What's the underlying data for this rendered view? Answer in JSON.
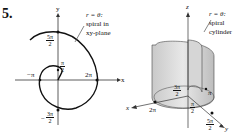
{
  "problem_number": "5.",
  "left_figure": {
    "axis_x": "x",
    "axis_y": "y",
    "annotation_line1": "r = θ:",
    "annotation_line2": "spiral in",
    "annotation_line3": "xy-plane",
    "tick_5pi2_num": "5π",
    "tick_5pi2_den": "2",
    "tick_pi2_num": "π",
    "tick_pi2_den": "2",
    "tick_neg_pi": "−π",
    "tick_2pi": "2π",
    "tick_neg3pi2_num": "3π",
    "tick_neg3pi2_den": "2",
    "tick_neg3pi2_sign": "−"
  },
  "right_figure": {
    "axis_x": "x",
    "axis_y": "y",
    "axis_z": "z",
    "annotation_line1": "r = θ:",
    "annotation_line2": "spiral",
    "annotation_line3": "cylinder",
    "tick_3pi2_num": "3π",
    "tick_3pi2_den": "2",
    "tick_pi": "π",
    "tick_pi2_num": "π",
    "tick_pi2_den": "2",
    "tick_2pi": "2π",
    "tick_5pi2_num": "5π",
    "tick_5pi2_den": "2"
  }
}
